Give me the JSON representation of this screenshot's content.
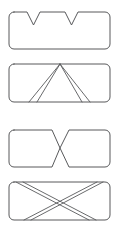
{
  "figure": {
    "background_color": "#ffffff",
    "stroke_color": "#58595b",
    "fill_color": "#ffffff",
    "canvas": {
      "width": 122,
      "height": 232
    },
    "panel_count": 4,
    "panels": [
      {
        "id": "panel-1",
        "name": "rounded-rectangle-two-top-v-notches",
        "description": "Rounded rectangle with two V-shaped notches cut into the top edge",
        "bounds": {
          "x": 9,
          "y": 12,
          "width": 101,
          "height": 37
        },
        "corner_radius": 5,
        "notches": [
          {
            "name": "left-v-notch",
            "left_x": 27,
            "apex_x": 33.5,
            "right_x": 40,
            "apex_y": 25
          },
          {
            "name": "right-v-notch",
            "left_x": 65,
            "apex_x": 71.5,
            "right_x": 78,
            "apex_y": 25
          }
        ],
        "internal_lines": []
      },
      {
        "id": "panel-2",
        "name": "rounded-rectangle-double-line-lambda",
        "description": "Rounded rectangle containing an inverted-V (lambda) drawn with doubled parallel lines meeting at the top edge",
        "bounds": {
          "x": 9,
          "y": 64,
          "width": 101,
          "height": 38
        },
        "corner_radius": 5,
        "notches": [],
        "internal_lines": [
          {
            "name": "lambda-left-outer",
            "x1": 60,
            "y1": 64,
            "x2": 29,
            "y2": 102
          },
          {
            "name": "lambda-left-inner",
            "x1": 60,
            "y1": 64,
            "x2": 37,
            "y2": 102
          },
          {
            "name": "lambda-right-inner",
            "x1": 60,
            "y1": 64,
            "x2": 82,
            "y2": 102
          },
          {
            "name": "lambda-right-outer",
            "x1": 60,
            "y1": 64,
            "x2": 90,
            "y2": 102
          }
        ]
      },
      {
        "id": "panel-3",
        "name": "rounded-rectangle-bowtie-notch",
        "description": "Rounded rectangle with a bowtie / hourglass waist formed by a top V notch and a bottom V notch meeting at the centre",
        "bounds": {
          "x": 9,
          "y": 130,
          "width": 101,
          "height": 37
        },
        "corner_radius": 5,
        "notches": [
          {
            "name": "top-center-v-notch",
            "left_x": 52,
            "apex_x": 60,
            "right_x": 69,
            "apex_y": 148
          },
          {
            "name": "bottom-center-v-notch",
            "left_x": 52,
            "apex_x": 60,
            "right_x": 69,
            "apex_y": 148
          }
        ],
        "internal_lines": []
      },
      {
        "id": "panel-4",
        "name": "rounded-rectangle-double-line-x",
        "description": "Rounded rectangle containing an X drawn with doubled parallel diagonal lines crossing near the centre",
        "bounds": {
          "x": 9,
          "y": 182,
          "width": 101,
          "height": 38
        },
        "corner_radius": 5,
        "notches": [],
        "internal_lines": [
          {
            "name": "x-diagonal-a-outer",
            "x1": 24,
            "y1": 220,
            "x2": 97,
            "y2": 182
          },
          {
            "name": "x-diagonal-a-inner",
            "x1": 31,
            "y1": 220,
            "x2": 103,
            "y2": 182
          },
          {
            "name": "x-diagonal-b-outer",
            "x1": 16,
            "y1": 182,
            "x2": 89,
            "y2": 220
          },
          {
            "name": "x-diagonal-b-inner",
            "x1": 23,
            "y1": 182,
            "x2": 96,
            "y2": 220
          }
        ],
        "crossing_point": {
          "x": 60,
          "y": 201
        }
      }
    ]
  }
}
